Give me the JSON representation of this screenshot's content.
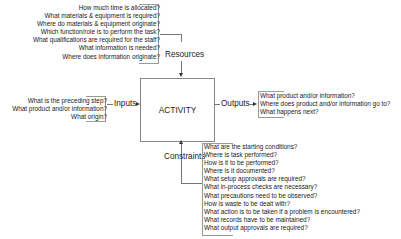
{
  "activity": {
    "label": "ACTIVITY"
  },
  "resources": {
    "label": "Resources",
    "questions": [
      "How much time is allocated?",
      "What materials & equipment is required?",
      "Where do materials & equipment originate?",
      "Which function/role is to perform the task?",
      "What qualifications are required for the staff?",
      "What information is needed?",
      "Where does information originate?"
    ]
  },
  "inputs": {
    "label": "Inputs",
    "questions": [
      "What is the preceding step?",
      "What product and/or information?",
      "What origin?"
    ]
  },
  "outputs": {
    "label": "Outputs",
    "questions": [
      "What product and/or  information?",
      "Where does product and/or information go to?",
      "What happens next?"
    ]
  },
  "constraints": {
    "label": "Constraints",
    "questions": [
      "What are the starting conditions?",
      "Where is task performed?",
      "How is it to be performed?",
      "Where is it documented?",
      "What setup approvals are required?",
      "What in-process checks are necessary?",
      "What precautions need to be observed?",
      "How is waste to be dealt with?",
      "What action is to be taken if a problem is encountered?",
      "What records have to be maintained?",
      "What output approvals are required?"
    ]
  }
}
